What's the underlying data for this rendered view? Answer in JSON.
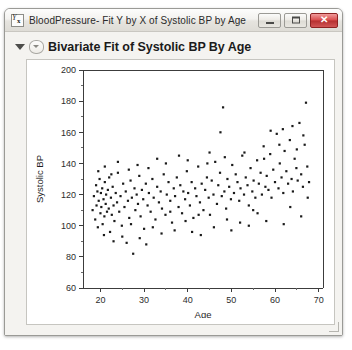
{
  "window": {
    "title": "BloodPressure- Fit Y by X of Systolic BP by Age",
    "icon": "yx-report-icon",
    "controls": {
      "minimize_label": "–",
      "maximize_label": "□",
      "close_label": "✕"
    }
  },
  "report": {
    "outline_title": "Bivariate Fit of Systolic BP By Age",
    "disclosure_icon": "triangle-down-icon",
    "badge_icon": "outline-badge-icon"
  },
  "chart_data": {
    "type": "scatter",
    "title": "Bivariate Fit of Systolic BP By Age",
    "xlabel": "Age",
    "ylabel": "Systolic BP",
    "xlim": [
      16,
      71
    ],
    "ylim": [
      60,
      200
    ],
    "xticks": [
      20,
      30,
      40,
      50,
      60,
      70
    ],
    "yticks": [
      60,
      80,
      100,
      120,
      140,
      160,
      180,
      200
    ],
    "x_minor_ticks": [
      25,
      35,
      45,
      55,
      65
    ],
    "grid": false,
    "legend": null,
    "marker": "small filled square",
    "marker_color": "#1a1a1a",
    "points": [
      [
        18.2,
        110
      ],
      [
        18.5,
        119
      ],
      [
        18.8,
        104
      ],
      [
        19.0,
        126
      ],
      [
        19.1,
        113
      ],
      [
        19.3,
        122
      ],
      [
        19.4,
        99
      ],
      [
        19.6,
        116
      ],
      [
        19.8,
        130
      ],
      [
        20.0,
        108
      ],
      [
        20.1,
        121
      ],
      [
        20.2,
        112
      ],
      [
        20.4,
        124
      ],
      [
        20.5,
        101
      ],
      [
        20.7,
        117
      ],
      [
        20.9,
        106
      ],
      [
        21.0,
        128
      ],
      [
        21.2,
        114
      ],
      [
        21.3,
        120
      ],
      [
        21.5,
        109
      ],
      [
        21.7,
        123
      ],
      [
        21.9,
        111
      ],
      [
        22.0,
        131
      ],
      [
        22.2,
        96
      ],
      [
        22.4,
        118
      ],
      [
        22.6,
        107
      ],
      [
        22.8,
        125
      ],
      [
        23.0,
        113
      ],
      [
        23.2,
        103
      ],
      [
        23.5,
        121
      ],
      [
        23.8,
        115
      ],
      [
        24.0,
        134
      ],
      [
        24.3,
        109
      ],
      [
        24.6,
        119
      ],
      [
        24.9,
        100
      ],
      [
        25.2,
        127
      ],
      [
        25.5,
        112
      ],
      [
        25.8,
        122
      ],
      [
        26.0,
        89
      ],
      [
        26.3,
        116
      ],
      [
        26.6,
        105
      ],
      [
        26.9,
        129
      ],
      [
        27.2,
        118
      ],
      [
        27.5,
        82
      ],
      [
        27.8,
        124
      ],
      [
        28.0,
        110
      ],
      [
        28.3,
        120
      ],
      [
        28.6,
        114
      ],
      [
        28.9,
        132
      ],
      [
        29.2,
        106
      ],
      [
        29.5,
        123
      ],
      [
        29.8,
        117
      ],
      [
        30.0,
        98
      ],
      [
        30.4,
        127
      ],
      [
        30.8,
        113
      ],
      [
        31.1,
        121
      ],
      [
        31.5,
        109
      ],
      [
        31.9,
        130
      ],
      [
        32.2,
        118
      ],
      [
        32.6,
        104
      ],
      [
        33.0,
        125
      ],
      [
        33.4,
        115
      ],
      [
        33.8,
        122
      ],
      [
        34.1,
        111
      ],
      [
        34.5,
        133
      ],
      [
        34.9,
        107
      ],
      [
        35.2,
        120
      ],
      [
        35.6,
        128
      ],
      [
        36.0,
        116
      ],
      [
        36.4,
        102
      ],
      [
        36.8,
        124
      ],
      [
        37.1,
        119
      ],
      [
        37.5,
        131
      ],
      [
        37.9,
        112
      ],
      [
        38.3,
        126
      ],
      [
        38.7,
        108
      ],
      [
        39.0,
        122
      ],
      [
        39.4,
        117
      ],
      [
        39.8,
        135
      ],
      [
        40.1,
        121
      ],
      [
        40.5,
        113
      ],
      [
        40.9,
        128
      ],
      [
        41.3,
        105
      ],
      [
        41.7,
        124
      ],
      [
        42.0,
        119
      ],
      [
        42.4,
        138
      ],
      [
        42.8,
        115
      ],
      [
        43.2,
        127
      ],
      [
        43.6,
        110
      ],
      [
        44.0,
        123
      ],
      [
        44.4,
        131
      ],
      [
        44.8,
        118
      ],
      [
        45.1,
        107
      ],
      [
        45.5,
        129
      ],
      [
        45.9,
        120
      ],
      [
        46.3,
        141
      ],
      [
        46.7,
        114
      ],
      [
        47.0,
        126
      ],
      [
        47.4,
        134
      ],
      [
        47.8,
        119
      ],
      [
        48.1,
        176
      ],
      [
        48.4,
        122
      ],
      [
        48.8,
        111
      ],
      [
        49.1,
        130
      ],
      [
        49.5,
        125
      ],
      [
        49.9,
        117
      ],
      [
        50.2,
        139
      ],
      [
        50.6,
        121
      ],
      [
        51.0,
        133
      ],
      [
        51.4,
        128
      ],
      [
        51.8,
        116
      ],
      [
        52.1,
        124
      ],
      [
        52.5,
        145
      ],
      [
        52.9,
        120
      ],
      [
        53.3,
        131
      ],
      [
        53.7,
        126
      ],
      [
        54.0,
        113
      ],
      [
        54.4,
        137
      ],
      [
        54.8,
        122
      ],
      [
        55.1,
        129
      ],
      [
        55.5,
        118
      ],
      [
        55.9,
        142
      ],
      [
        56.3,
        127
      ],
      [
        56.7,
        134
      ],
      [
        57.0,
        120
      ],
      [
        57.4,
        151
      ],
      [
        57.8,
        125
      ],
      [
        58.1,
        132
      ],
      [
        58.5,
        123
      ],
      [
        58.9,
        146
      ],
      [
        59.2,
        118
      ],
      [
        59.6,
        136
      ],
      [
        60.0,
        128
      ],
      [
        60.4,
        159
      ],
      [
        60.8,
        124
      ],
      [
        61.1,
        140
      ],
      [
        61.5,
        131
      ],
      [
        61.9,
        121
      ],
      [
        62.2,
        148
      ],
      [
        62.6,
        135
      ],
      [
        63.0,
        127
      ],
      [
        63.4,
        155
      ],
      [
        63.8,
        130
      ],
      [
        64.1,
        122
      ],
      [
        64.5,
        143
      ],
      [
        64.9,
        137
      ],
      [
        65.2,
        129
      ],
      [
        65.6,
        166
      ],
      [
        66.0,
        133
      ],
      [
        66.4,
        125
      ],
      [
        66.8,
        152
      ],
      [
        67.1,
        179
      ],
      [
        67.4,
        138
      ],
      [
        67.8,
        128
      ],
      [
        19.5,
        135
      ],
      [
        22.5,
        133
      ],
      [
        26.5,
        136
      ],
      [
        31.0,
        137
      ],
      [
        35.0,
        140
      ],
      [
        40.0,
        142
      ],
      [
        44.5,
        140
      ],
      [
        48.5,
        144
      ],
      [
        53.0,
        147
      ],
      [
        57.5,
        143
      ],
      [
        61.0,
        152
      ],
      [
        65.0,
        149
      ],
      [
        66.5,
        158
      ],
      [
        59.0,
        161
      ],
      [
        61.8,
        162
      ],
      [
        64.0,
        164
      ],
      [
        47.5,
        160
      ],
      [
        45.0,
        147
      ],
      [
        38.0,
        145
      ],
      [
        33.0,
        143
      ],
      [
        28.5,
        139
      ],
      [
        24.0,
        141
      ],
      [
        21.0,
        138
      ],
      [
        23.0,
        90
      ],
      [
        25.0,
        93
      ],
      [
        29.0,
        92
      ],
      [
        34.0,
        95
      ],
      [
        37.0,
        97
      ],
      [
        41.0,
        96
      ],
      [
        46.0,
        99
      ],
      [
        50.0,
        97
      ],
      [
        54.0,
        100
      ],
      [
        58.0,
        103
      ],
      [
        62.0,
        101
      ],
      [
        66.0,
        106
      ],
      [
        30.5,
        88
      ],
      [
        43.0,
        94
      ],
      [
        52.0,
        102
      ],
      [
        56.0,
        108
      ],
      [
        63.5,
        112
      ],
      [
        67.5,
        118
      ],
      [
        20.8,
        94
      ],
      [
        27.0,
        101
      ],
      [
        32.0,
        99
      ],
      [
        36.0,
        109
      ],
      [
        39.5,
        103
      ],
      [
        42.5,
        107
      ],
      [
        49.0,
        104
      ],
      [
        55.0,
        110
      ]
    ]
  }
}
